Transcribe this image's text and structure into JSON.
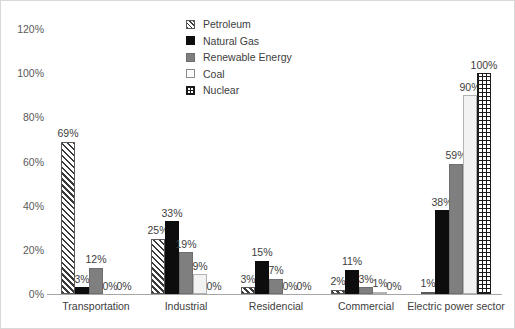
{
  "chart_data": {
    "type": "bar",
    "title": "",
    "subtitle": "",
    "xlabel": "",
    "ylabel": "",
    "ylim": [
      0,
      120
    ],
    "ytick_labels": [
      "120%",
      "100%",
      "80%",
      "60%",
      "40%",
      "20%",
      "0%"
    ],
    "ytick_values": [
      120,
      100,
      80,
      60,
      40,
      20,
      0
    ],
    "grid": false,
    "legend_position": "top-center",
    "categories": [
      "Transportation",
      "Industrial",
      "Residencial",
      "Commercial",
      "Electric power sector"
    ],
    "series": [
      {
        "name": "Petroleum",
        "values": [
          69,
          25,
          3,
          2,
          1
        ],
        "labels": [
          "69%",
          "25%",
          "3%",
          "2%",
          "1%"
        ],
        "pattern": "diagonal-hatch",
        "color": "#3a3a3a"
      },
      {
        "name": "Natural Gas",
        "values": [
          3,
          33,
          15,
          11,
          38
        ],
        "labels": [
          "3%",
          "33%",
          "15%",
          "11%",
          "38%"
        ],
        "pattern": "solid",
        "color": "#0d0d0d"
      },
      {
        "name": "Renewable Energy",
        "values": [
          12,
          19,
          7,
          3,
          59
        ],
        "labels": [
          "12%",
          "19%",
          "7%",
          "3%",
          "59%"
        ],
        "pattern": "solid",
        "color": "#7f7f7f"
      },
      {
        "name": "Coal",
        "values": [
          0,
          9,
          0,
          1,
          90
        ],
        "labels": [
          "0%",
          "9%",
          "0%",
          "1%",
          "90%"
        ],
        "pattern": "empty",
        "color": "#f2f2f2"
      },
      {
        "name": "Nuclear",
        "values": [
          0,
          0,
          0,
          0,
          100
        ],
        "labels": [
          "0%",
          "0%",
          "0%",
          "0%",
          "100%"
        ],
        "pattern": "grid-dots",
        "color": "#1a1a1a"
      }
    ]
  },
  "legend": {
    "items": [
      {
        "label": "Petroleum",
        "swatch": "petroleum-swatch"
      },
      {
        "label": "Natural Gas",
        "swatch": "natural-gas-swatch"
      },
      {
        "label": "Renewable Energy",
        "swatch": "renewable-energy-swatch"
      },
      {
        "label": "Coal",
        "swatch": "coal-swatch"
      },
      {
        "label": "Nuclear",
        "swatch": "nuclear-swatch"
      }
    ]
  }
}
